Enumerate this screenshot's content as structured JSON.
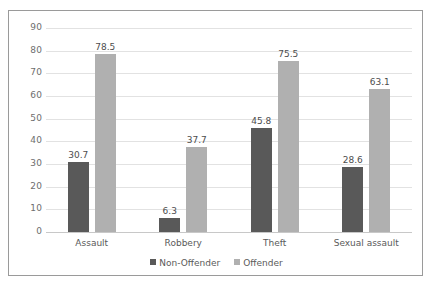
{
  "chart_data": {
    "type": "bar",
    "title": "",
    "subtitle": "",
    "xlabel": "",
    "ylabel": "",
    "ylim": [
      0,
      90
    ],
    "ytick_step": 10,
    "yticks": [
      0,
      10,
      20,
      30,
      40,
      50,
      60,
      70,
      80,
      90
    ],
    "grid": true,
    "legend_position": "bottom",
    "categories": [
      "Assault",
      "Robbery",
      "Theft",
      "Sexual assault"
    ],
    "series": [
      {
        "name": "Non-Offender",
        "color": "#595959",
        "values": [
          30.7,
          6.3,
          45.8,
          28.6
        ],
        "labels": [
          "30.7",
          "6.3",
          "45.8",
          "28.6"
        ]
      },
      {
        "name": "Offender",
        "color": "#b0b0b0",
        "values": [
          78.5,
          37.7,
          75.5,
          63.1
        ],
        "labels": [
          "78.5",
          "37.7",
          "75.5",
          "63.1"
        ]
      }
    ]
  },
  "colors": {
    "non_offender": "#595959",
    "offender": "#b0b0b0",
    "gridline": "#e2e2e2",
    "axis": "#c8c8c8",
    "frame": "#9a9a9a",
    "text": "#5a5a5a",
    "background": "#ffffff"
  }
}
